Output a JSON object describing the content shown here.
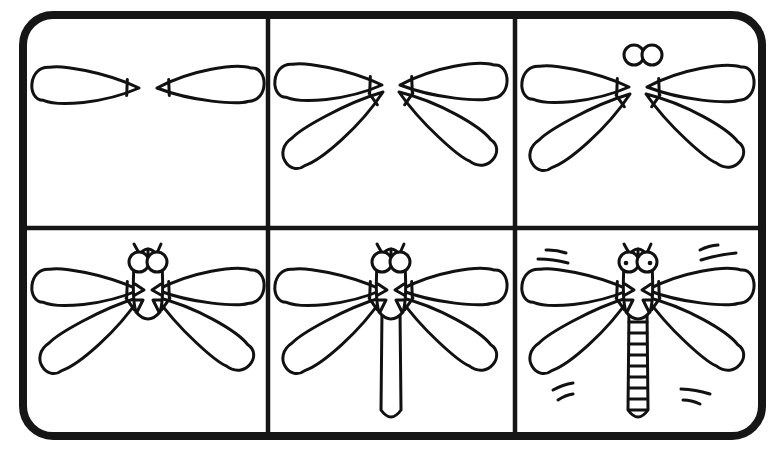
{
  "title": {
    "text": "",
    "note": "cropped title text at top edge, not legible"
  },
  "colors": {
    "ink": "#111111",
    "background": "#ffffff",
    "frame": "#161616"
  },
  "frame": {
    "x": 23,
    "y": 15,
    "width": 739,
    "height": 421,
    "radius": 30
  },
  "dividers": {
    "vertical_x": [
      268,
      515
    ],
    "horizontal_y": [
      228
    ]
  },
  "panels": [
    {
      "step": 1,
      "label": "step-1-upper-wings",
      "cx": 148,
      "wing_y": 88,
      "parts": [
        "upper-wings"
      ]
    },
    {
      "step": 2,
      "label": "step-2-lower-wings",
      "cx": 391,
      "wing_y": 85,
      "parts": [
        "upper-wings",
        "lower-wings"
      ]
    },
    {
      "step": 3,
      "label": "step-3-eyes",
      "cx": 638,
      "wing_y": 87,
      "parts": [
        "upper-wings",
        "lower-wings",
        "eyes"
      ]
    },
    {
      "step": 4,
      "label": "step-4-body",
      "cx": 148,
      "wing_y": 290,
      "parts": [
        "upper-wings",
        "lower-wings",
        "eyes",
        "head",
        "thorax"
      ]
    },
    {
      "step": 5,
      "label": "step-5-tail",
      "cx": 391,
      "wing_y": 290,
      "parts": [
        "upper-wings",
        "lower-wings",
        "eyes",
        "head",
        "thorax",
        "tail"
      ]
    },
    {
      "step": 6,
      "label": "step-6-details",
      "cx": 638,
      "wing_y": 290,
      "parts": [
        "upper-wings",
        "lower-wings",
        "eyes",
        "head",
        "thorax",
        "tail",
        "tail-segments",
        "pupils",
        "motion-lines"
      ]
    }
  ]
}
